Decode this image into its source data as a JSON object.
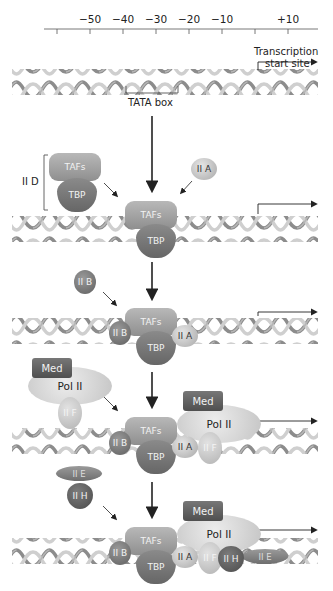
{
  "scale": {
    "ticks": [
      "−50",
      "−40",
      "−30",
      "−20",
      "−10",
      "+10"
    ],
    "tick_x": [
      90,
      123,
      156,
      189,
      222,
      288
    ]
  },
  "labels": {
    "transcription_start": "Transcription",
    "transcription_start_2": "start site",
    "tata_box": "TATA box",
    "iid": "II D"
  },
  "factors": {
    "tafs": "TAFs",
    "tbp": "TBP",
    "iia": "II A",
    "iib": "II B",
    "med": "Med",
    "pol2": "Pol II",
    "iif": "II F",
    "iie": "II E",
    "iih": "II H"
  },
  "colors": {
    "dna_light": "#d9d9d9",
    "dna_dark": "#8c8c8c",
    "arrow": "#222222"
  }
}
